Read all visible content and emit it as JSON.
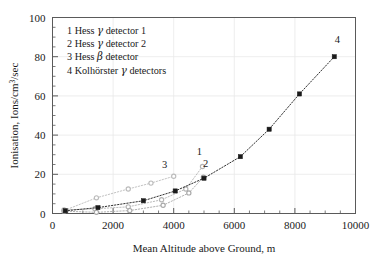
{
  "chart_data": {
    "type": "scatter",
    "title": "",
    "xlabel": "Mean Altitude above Ground, m",
    "ylabel": "Ionisation, Ions/cm3/sec",
    "ylabel_display": "Ionisation, Ions/cm³/sec",
    "xlim": [
      0,
      10000
    ],
    "ylim": [
      0,
      100
    ],
    "xticks": [
      0,
      2000,
      4000,
      6000,
      8000,
      10000
    ],
    "xtick_labels": [
      "0",
      "2000",
      "4000",
      "6000",
      "8000",
      "10000"
    ],
    "yticks": [
      0,
      20,
      40,
      60,
      80,
      100
    ],
    "ytick_labels": [
      "0",
      "20",
      "40",
      "60",
      "80",
      "100"
    ],
    "x_minor_step": 500,
    "y_minor_step": 5,
    "grid": true,
    "grid_color": "#e8e8e8",
    "legend_position": "upper-left-inside",
    "legend_entries": [
      {
        "key": "1",
        "text": "Hess γ detector 1",
        "pre": "Hess ",
        "greek": "γ",
        "post": " detector 1"
      },
      {
        "key": "2",
        "text": "Hess γ detector 2",
        "pre": "Hess ",
        "greek": "γ",
        "post": " detector 2"
      },
      {
        "key": "3",
        "text": "Hess β detector",
        "pre": "Hess ",
        "greek": "β",
        "post": " detector"
      },
      {
        "key": "4",
        "text": "Kolhörster γ detectors",
        "pre": "Kolhörster ",
        "greek": "γ",
        "post": " detectors"
      }
    ],
    "series": [
      {
        "name": "Hess γ detector 1",
        "label": "1",
        "color": "#b4b4b4",
        "marker": "circle-open",
        "line": "dotted",
        "label_x": 4850,
        "label_y": 30,
        "points": [
          {
            "x": 380,
            "y": 1.8
          },
          {
            "x": 1400,
            "y": 2.4
          },
          {
            "x": 2500,
            "y": 3.4
          },
          {
            "x": 3600,
            "y": 7.0
          },
          {
            "x": 4400,
            "y": 12.5
          },
          {
            "x": 4950,
            "y": 24.0
          }
        ]
      },
      {
        "name": "Hess γ detector 2",
        "label": "2",
        "color": "#a8a8a8",
        "marker": "circle-open",
        "line": "dotted",
        "label_x": 5050,
        "label_y": 23.5,
        "points": [
          {
            "x": 380,
            "y": 1.2
          },
          {
            "x": 1450,
            "y": 0.6
          },
          {
            "x": 2550,
            "y": 1.5
          },
          {
            "x": 3650,
            "y": 4.2
          },
          {
            "x": 4500,
            "y": 10.5
          },
          {
            "x": 4980,
            "y": 18.5
          }
        ]
      },
      {
        "name": "Hess β detector",
        "label": "3",
        "color": "#bcbcbc",
        "marker": "circle-open",
        "line": "dotted",
        "label_x": 3700,
        "label_y": 23.0,
        "points": [
          {
            "x": 400,
            "y": 1.6
          },
          {
            "x": 1450,
            "y": 8.0
          },
          {
            "x": 2500,
            "y": 12.5
          },
          {
            "x": 3250,
            "y": 15.5
          },
          {
            "x": 4000,
            "y": 19.0
          }
        ]
      },
      {
        "name": "Kolhörster γ detectors",
        "label": "4",
        "color": "#1a1a1a",
        "marker": "square-filled",
        "line": "dotted",
        "label_x": 9400,
        "label_y": 87,
        "points": [
          {
            "x": 420,
            "y": 1.4
          },
          {
            "x": 1500,
            "y": 3.0
          },
          {
            "x": 3000,
            "y": 6.5
          },
          {
            "x": 4050,
            "y": 11.5
          },
          {
            "x": 5000,
            "y": 18.0
          },
          {
            "x": 6200,
            "y": 29.0
          },
          {
            "x": 7150,
            "y": 43.0
          },
          {
            "x": 8150,
            "y": 61.0
          },
          {
            "x": 9300,
            "y": 80.0
          }
        ]
      }
    ]
  }
}
